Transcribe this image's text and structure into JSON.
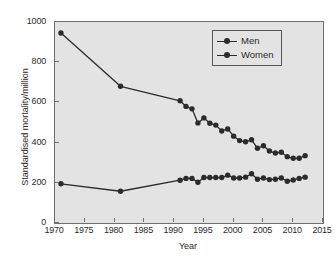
{
  "chart_data": {
    "type": "line",
    "title": "",
    "subtitle": "",
    "xlabel": "Year",
    "ylabel": "Standardised mortality/million",
    "xlim": [
      1970,
      2015
    ],
    "ylim": [
      0,
      1000
    ],
    "xticks": [
      1970,
      1975,
      1980,
      1985,
      1990,
      1995,
      2000,
      2005,
      2010,
      2015
    ],
    "yticks": [
      0,
      200,
      400,
      600,
      800,
      1000
    ],
    "grid": false,
    "legend_position": "top-right",
    "legend_entries": [
      "Men",
      "Women"
    ],
    "marker": "filled-circle",
    "series": [
      {
        "name": "Men",
        "color": "#2b2b2b",
        "x": [
          1971,
          1981,
          1991,
          1992,
          1993,
          1994,
          1995,
          1996,
          1997,
          1998,
          1999,
          2000,
          2001,
          2002,
          2003,
          2004,
          2005,
          2006,
          2007,
          2008,
          2009,
          2010,
          2011,
          2012
        ],
        "values": [
          945,
          680,
          608,
          580,
          568,
          498,
          523,
          496,
          487,
          458,
          468,
          432,
          410,
          404,
          414,
          372,
          384,
          358,
          348,
          352,
          330,
          322,
          322,
          335
        ]
      },
      {
        "name": "Women",
        "color": "#2b2b2b",
        "x": [
          1971,
          1981,
          1991,
          1992,
          1993,
          1994,
          1995,
          1996,
          1997,
          1998,
          1999,
          2000,
          2001,
          2002,
          2003,
          2004,
          2005,
          2006,
          2007,
          2008,
          2009,
          2010,
          2011,
          2012
        ],
        "values": [
          195,
          158,
          213,
          222,
          222,
          203,
          226,
          226,
          226,
          226,
          238,
          224,
          224,
          228,
          245,
          218,
          224,
          216,
          218,
          224,
          208,
          214,
          222,
          228
        ]
      }
    ]
  },
  "axes": {
    "x_tick_labels": [
      "1970",
      "1975",
      "1980",
      "1985",
      "1990",
      "1995",
      "2000",
      "2005",
      "2010",
      "2015"
    ],
    "y_tick_labels": [
      "0",
      "200",
      "400",
      "600",
      "800",
      "1000"
    ],
    "x_title": "Year",
    "y_title": "Standardised mortality/million"
  },
  "legend": {
    "items": [
      {
        "label": "Men",
        "marker": "filled-circle-line-marker"
      },
      {
        "label": "Women",
        "marker": "filled-circle-line-marker"
      }
    ]
  },
  "style": {
    "plot_background": "#e3e3e3",
    "page_background": "#ffffff",
    "line_color": "#2b2b2b",
    "frame_color": "#6f6f6f"
  }
}
